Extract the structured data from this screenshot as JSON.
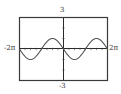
{
  "chart_data": {
    "type": "line",
    "title": "",
    "xlabel": "",
    "ylabel": "",
    "xlim": [
      -6.2832,
      6.2832
    ],
    "ylim": [
      -3,
      3
    ],
    "x_tick_labels": [
      "-2π",
      "2π"
    ],
    "y_tick_labels": [
      "3",
      "-3"
    ],
    "grid": false,
    "legend": null,
    "series": [
      {
        "name": "y = -sin(x)",
        "x": [
          -6.2832,
          -5.4978,
          -4.7124,
          -3.927,
          -3.1416,
          -2.3562,
          -1.5708,
          -0.7854,
          0,
          0.7854,
          1.5708,
          2.3562,
          3.1416,
          3.927,
          4.7124,
          5.4978,
          6.2832
        ],
        "values": [
          0,
          -0.707,
          -1,
          -0.707,
          0,
          0.707,
          1,
          0.707,
          0,
          -0.707,
          -1,
          -0.707,
          0,
          0.707,
          1,
          0.707,
          0
        ]
      }
    ]
  },
  "labels": {
    "y_max": "3",
    "y_min": "-3",
    "x_min": "-2π",
    "x_max": "2π"
  },
  "colors": {
    "frame": "#3a3a3a",
    "axis": "#2a2a2a",
    "curve": "#555555"
  }
}
